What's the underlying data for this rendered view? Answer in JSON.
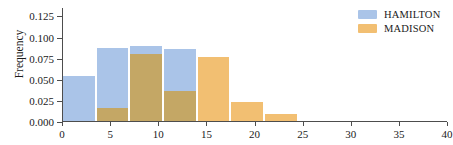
{
  "chart_data": {
    "type": "bar",
    "title": "",
    "xlabel": "",
    "ylabel": "Frequency",
    "xlim": [
      0,
      40
    ],
    "ylim": [
      0.0,
      0.135
    ],
    "grid": false,
    "legend_position": "upper right",
    "bin_width": 3.5,
    "bin_edges": [
      0,
      3.5,
      7,
      10.5,
      14,
      17.5,
      21,
      24.5
    ],
    "yticks": [
      0.0,
      0.025,
      0.05,
      0.075,
      0.1,
      0.125
    ],
    "ytick_labels": [
      "0.000",
      "0.025",
      "0.050",
      "0.075",
      "0.100",
      "0.125"
    ],
    "xticks": [
      0,
      5,
      10,
      15,
      20,
      25,
      30,
      35,
      40
    ],
    "xtick_labels": [
      "0",
      "5",
      "10",
      "15",
      "20",
      "25",
      "30",
      "35",
      "40"
    ],
    "categories": [
      "0-3.5",
      "3.5-7",
      "7-10.5",
      "10.5-14",
      "14-17.5",
      "17.5-21",
      "21-24.5"
    ],
    "series": [
      {
        "name": "HAMILTON",
        "color": "#aac4e8",
        "values": [
          0.053,
          0.086,
          0.089,
          0.085,
          0.0,
          0.0,
          0.0
        ]
      },
      {
        "name": "MADISON",
        "color": "#f2bf72",
        "values": [
          0.0,
          0.015,
          0.079,
          0.035,
          0.076,
          0.022,
          0.008
        ]
      }
    ],
    "overlap_color": "#c4a765"
  },
  "legend": {
    "items": [
      {
        "label": "HAMILTON",
        "color": "#aac4e8"
      },
      {
        "label": "MADISON",
        "color": "#f2bf72"
      }
    ]
  },
  "axes": {
    "ylabel": "Frequency"
  }
}
